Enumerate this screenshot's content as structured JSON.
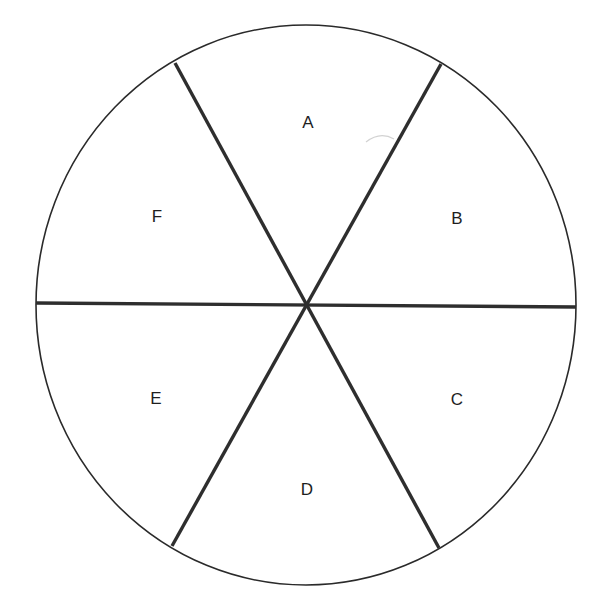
{
  "diagram": {
    "type": "circle-divided-into-six-sectors",
    "colors": {
      "background": "#ffffff",
      "outline": "#2a2a2a",
      "divider": "#2e2e2e",
      "label": "#1e1e1e",
      "artifact": "#cfcfcf"
    },
    "circle": {
      "cx": 306,
      "cy": 305,
      "rx": 270,
      "ry": 280
    },
    "center_point": {
      "x": 307,
      "y": 305
    },
    "dividers": [
      {
        "x1": 36,
        "y1": 303,
        "x2": 576,
        "y2": 307
      },
      {
        "x1": 175,
        "y1": 63,
        "x2": 439,
        "y2": 548
      },
      {
        "x1": 441,
        "y1": 64,
        "x2": 172,
        "y2": 546
      }
    ],
    "sectors": [
      {
        "label": "A",
        "x": 308,
        "y": 122
      },
      {
        "label": "B",
        "x": 457,
        "y": 218
      },
      {
        "label": "C",
        "x": 457,
        "y": 399
      },
      {
        "label": "D",
        "x": 307,
        "y": 489
      },
      {
        "label": "E",
        "x": 156,
        "y": 398
      },
      {
        "label": "F",
        "x": 157,
        "y": 216
      }
    ]
  }
}
